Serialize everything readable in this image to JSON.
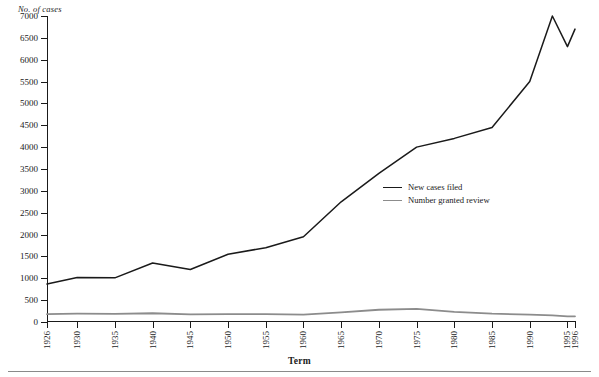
{
  "chart_data": {
    "type": "line",
    "title": "",
    "xlabel": "Term",
    "ylabel": "No. of cases",
    "grid": false,
    "legend_position": "inside-right",
    "ylim": [
      0,
      7000
    ],
    "ytick_step": 500,
    "yticks": [
      0,
      500,
      1000,
      1500,
      2000,
      2500,
      3000,
      3500,
      4000,
      4500,
      5000,
      5500,
      6000,
      6500,
      7000
    ],
    "ytick_labels": [
      "0",
      "500",
      "1000",
      "1500",
      "2000",
      "2500",
      "3000",
      "3500",
      "4000",
      "4500",
      "5000",
      "5500",
      "6000",
      "6500",
      "7000"
    ],
    "xlim": [
      1926,
      1996
    ],
    "xticks": [
      1926,
      1930,
      1935,
      1940,
      1945,
      1950,
      1955,
      1960,
      1965,
      1970,
      1975,
      1980,
      1985,
      1990,
      1995,
      1996
    ],
    "xtick_labels": [
      "1926",
      "1930",
      "1935",
      "1940",
      "1945",
      "1950",
      "1955",
      "1960",
      "1965",
      "1970",
      "1975",
      "1980",
      "1985",
      "1990",
      "1995",
      "1996"
    ],
    "x": [
      1926,
      1930,
      1935,
      1940,
      1945,
      1950,
      1955,
      1960,
      1965,
      1970,
      1975,
      1980,
      1985,
      1990,
      1993,
      1995,
      1996
    ],
    "series": [
      {
        "name": "New cases filed",
        "color": "#1a1a1a",
        "values": [
          870,
          1020,
          1010,
          1350,
          1200,
          1550,
          1700,
          1950,
          2750,
          3400,
          4000,
          4200,
          4450,
          5500,
          7000,
          6300,
          6700
        ]
      },
      {
        "name": "Number granted review",
        "color": "#8c8c8c",
        "values": [
          180,
          190,
          185,
          200,
          175,
          180,
          180,
          170,
          220,
          280,
          300,
          230,
          190,
          170,
          150,
          130,
          130
        ]
      }
    ],
    "legend": [
      {
        "label": "New cases filed",
        "color": "#1a1a1a"
      },
      {
        "label": "Number granted review",
        "color": "#8c8c8c"
      }
    ]
  }
}
